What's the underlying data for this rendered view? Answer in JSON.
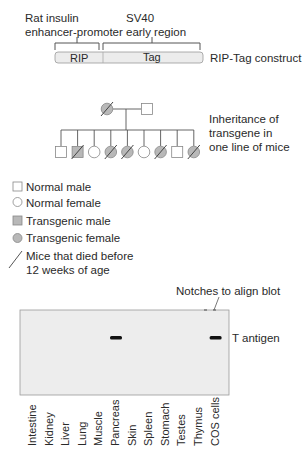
{
  "construct": {
    "promoter_label_line1": "Rat insulin",
    "promoter_label_line2": "enhancer-promoter",
    "region_label_line1": "SV40",
    "region_label_line2": "early region",
    "segment_rip": "RIP",
    "segment_tag": "Tag",
    "construct_name": "RIP-Tag construct"
  },
  "pedigree": {
    "caption_line1": "Inheritance of",
    "caption_line2": "transgene in",
    "caption_line3": "one line of mice",
    "parents": [
      {
        "sex": "female",
        "transgenic": true,
        "died": true
      },
      {
        "sex": "male",
        "transgenic": false,
        "died": false
      }
    ],
    "children": [
      {
        "sex": "male",
        "transgenic": false,
        "died": false
      },
      {
        "sex": "male",
        "transgenic": true,
        "died": true
      },
      {
        "sex": "female",
        "transgenic": false,
        "died": false
      },
      {
        "sex": "female",
        "transgenic": true,
        "died": true
      },
      {
        "sex": "female",
        "transgenic": true,
        "died": true
      },
      {
        "sex": "female",
        "transgenic": false,
        "died": false
      },
      {
        "sex": "female",
        "transgenic": true,
        "died": true
      },
      {
        "sex": "male",
        "transgenic": false,
        "died": false
      },
      {
        "sex": "female",
        "transgenic": true,
        "died": true
      }
    ]
  },
  "legend": {
    "normal_male": "Normal male",
    "normal_female": "Normal female",
    "transgenic_male": "Transgenic male",
    "transgenic_female": "Transgenic female",
    "died_line1": "Mice that died before",
    "died_line2": "12 weeks of age"
  },
  "blot": {
    "notches_label": "Notches to align blot",
    "band_label": "T antigen",
    "lanes": [
      "Intestine",
      "Kidney",
      "Liver",
      "Lung",
      "Muscle",
      "Pancreas",
      "Skin",
      "Spleen",
      "Stomach",
      "Testes",
      "Thymus",
      "COS cells"
    ],
    "bands_present": [
      false,
      false,
      false,
      false,
      false,
      true,
      false,
      false,
      false,
      false,
      false,
      true
    ]
  },
  "colors": {
    "line": "#555555",
    "transgenic_fill": "#b8b8b8",
    "construct_fill": "#ececec",
    "blot_fill": "#ededed",
    "band": "#111111"
  }
}
